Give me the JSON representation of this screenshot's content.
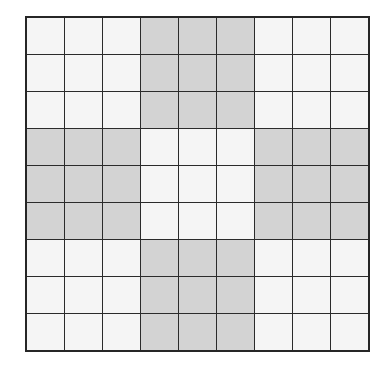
{
  "figure": {
    "name": "shaded-grid-pattern",
    "rows": 9,
    "columns": 9,
    "colors": {
      "shaded_cell": "#d3d3d3",
      "light_cell": "#f5f5f5",
      "grid_line": "#2b2b2b",
      "outer_border": "#262626",
      "background": "#ffffff"
    }
  },
  "chart_data": {
    "type": "heatmap",
    "title": "",
    "xlabel": "",
    "ylabel": "",
    "rows": 9,
    "columns": 9,
    "value_legend": {
      "0": "light",
      "1": "shaded"
    },
    "grid": [
      [
        0,
        0,
        0,
        1,
        1,
        1,
        0,
        0,
        0
      ],
      [
        0,
        0,
        0,
        1,
        1,
        1,
        0,
        0,
        0
      ],
      [
        0,
        0,
        0,
        1,
        1,
        1,
        0,
        0,
        0
      ],
      [
        1,
        1,
        1,
        0,
        0,
        0,
        1,
        1,
        1
      ],
      [
        1,
        1,
        1,
        0,
        0,
        0,
        1,
        1,
        1
      ],
      [
        1,
        1,
        1,
        0,
        0,
        0,
        1,
        1,
        1
      ],
      [
        0,
        0,
        0,
        1,
        1,
        1,
        0,
        0,
        0
      ],
      [
        0,
        0,
        0,
        1,
        1,
        1,
        0,
        0,
        0
      ],
      [
        0,
        0,
        0,
        1,
        1,
        1,
        0,
        0,
        0
      ]
    ],
    "shaded_count": 36,
    "light_count": 45,
    "total_cells": 81
  }
}
